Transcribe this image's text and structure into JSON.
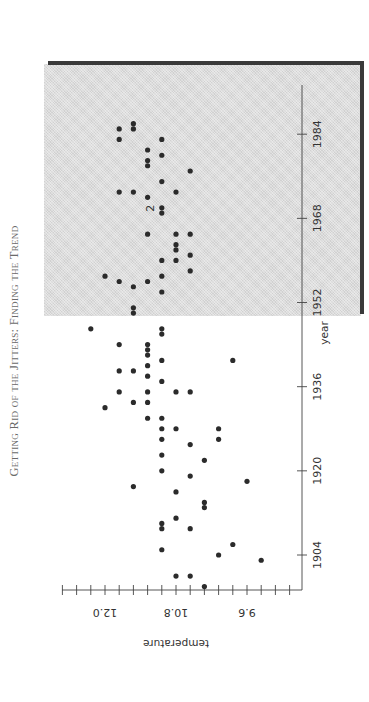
{
  "page": {
    "running_head": "Getting Rid of the Jitters: Finding the Trend"
  },
  "chart_data": {
    "type": "scatter",
    "orientation": "rotated 90° clockwise (year axis vertical, increasing upward; temperature axis horizontal, increasing leftward)",
    "title": "",
    "xlabel": "year",
    "ylabel": "temperature",
    "x_ticks": [
      1904,
      1920,
      1936,
      1952,
      1968,
      1984
    ],
    "y_ticks": [
      "9.6",
      "10.8",
      "12.0"
    ],
    "y_minor_tick_step": 0.24,
    "xlim": [
      1897,
      1995
    ],
    "ylim": [
      9.12,
      12.48
    ],
    "grid": false,
    "legend": null,
    "annotations": [
      {
        "text": "2",
        "x": 1970,
        "y": 11.1,
        "meaning": "two coincident points"
      }
    ],
    "points": [
      {
        "x": 1898,
        "y": 10.32
      },
      {
        "x": 1900,
        "y": 10.56
      },
      {
        "x": 1900,
        "y": 10.8
      },
      {
        "x": 1903,
        "y": 9.36
      },
      {
        "x": 1904,
        "y": 10.08
      },
      {
        "x": 1905,
        "y": 11.04
      },
      {
        "x": 1906,
        "y": 9.84
      },
      {
        "x": 1909,
        "y": 10.56
      },
      {
        "x": 1909,
        "y": 11.04
      },
      {
        "x": 1910,
        "y": 11.04
      },
      {
        "x": 1911,
        "y": 10.8
      },
      {
        "x": 1913,
        "y": 10.32
      },
      {
        "x": 1914,
        "y": 10.32
      },
      {
        "x": 1916,
        "y": 10.8
      },
      {
        "x": 1917,
        "y": 11.52
      },
      {
        "x": 1918,
        "y": 9.6
      },
      {
        "x": 1919,
        "y": 10.56
      },
      {
        "x": 1920,
        "y": 11.04
      },
      {
        "x": 1922,
        "y": 10.32
      },
      {
        "x": 1923,
        "y": 11.04
      },
      {
        "x": 1925,
        "y": 10.56
      },
      {
        "x": 1926,
        "y": 11.04
      },
      {
        "x": 1926,
        "y": 10.08
      },
      {
        "x": 1928,
        "y": 10.8
      },
      {
        "x": 1928,
        "y": 10.08
      },
      {
        "x": 1928,
        "y": 11.04
      },
      {
        "x": 1930,
        "y": 11.28
      },
      {
        "x": 1930,
        "y": 11.04
      },
      {
        "x": 1932,
        "y": 12.0
      },
      {
        "x": 1933,
        "y": 11.52
      },
      {
        "x": 1933,
        "y": 11.28
      },
      {
        "x": 1935,
        "y": 11.76
      },
      {
        "x": 1935,
        "y": 11.28
      },
      {
        "x": 1935,
        "y": 10.8
      },
      {
        "x": 1935,
        "y": 10.56
      },
      {
        "x": 1937,
        "y": 11.04
      },
      {
        "x": 1938,
        "y": 11.28
      },
      {
        "x": 1939,
        "y": 11.52
      },
      {
        "x": 1939,
        "y": 11.76
      },
      {
        "x": 1940,
        "y": 11.28
      },
      {
        "x": 1941,
        "y": 11.04
      },
      {
        "x": 1941,
        "y": 9.84
      },
      {
        "x": 1942,
        "y": 11.28
      },
      {
        "x": 1943,
        "y": 11.28
      },
      {
        "x": 1944,
        "y": 11.76
      },
      {
        "x": 1944,
        "y": 11.28
      },
      {
        "x": 1946,
        "y": 11.04
      },
      {
        "x": 1947,
        "y": 11.04
      },
      {
        "x": 1947,
        "y": 12.24
      },
      {
        "x": 1950,
        "y": 11.52
      },
      {
        "x": 1951,
        "y": 11.52
      },
      {
        "x": 1954,
        "y": 11.04
      },
      {
        "x": 1955,
        "y": 11.52
      },
      {
        "x": 1956,
        "y": 11.76
      },
      {
        "x": 1956,
        "y": 11.28
      },
      {
        "x": 1957,
        "y": 12.0
      },
      {
        "x": 1957,
        "y": 11.04
      },
      {
        "x": 1958,
        "y": 10.56
      },
      {
        "x": 1960,
        "y": 11.04
      },
      {
        "x": 1960,
        "y": 10.8
      },
      {
        "x": 1961,
        "y": 10.56
      },
      {
        "x": 1962,
        "y": 10.8
      },
      {
        "x": 1963,
        "y": 10.8
      },
      {
        "x": 1965,
        "y": 11.28
      },
      {
        "x": 1965,
        "y": 10.8
      },
      {
        "x": 1965,
        "y": 10.56
      },
      {
        "x": 1969,
        "y": 11.04
      },
      {
        "x": 1970,
        "y": 11.04
      },
      {
        "x": 1972,
        "y": 11.28
      },
      {
        "x": 1973,
        "y": 10.8
      },
      {
        "x": 1973,
        "y": 11.76
      },
      {
        "x": 1973,
        "y": 11.52
      },
      {
        "x": 1975,
        "y": 11.04
      },
      {
        "x": 1977,
        "y": 10.56
      },
      {
        "x": 1978,
        "y": 11.28
      },
      {
        "x": 1979,
        "y": 11.28
      },
      {
        "x": 1981,
        "y": 11.28
      },
      {
        "x": 1980,
        "y": 11.04
      },
      {
        "x": 1983,
        "y": 11.04
      },
      {
        "x": 1983,
        "y": 11.76
      },
      {
        "x": 1985,
        "y": 11.52
      },
      {
        "x": 1985,
        "y": 11.76
      },
      {
        "x": 1986,
        "y": 11.52
      }
    ]
  },
  "axes": {
    "year_label": "year",
    "temp_label": "temperature",
    "year_ticks": [
      "1904",
      "1920",
      "1936",
      "1952",
      "1968",
      "1984"
    ],
    "temp_ticks": [
      "12.0",
      "10.8",
      "9.6"
    ],
    "point_count_annotation": "2"
  }
}
